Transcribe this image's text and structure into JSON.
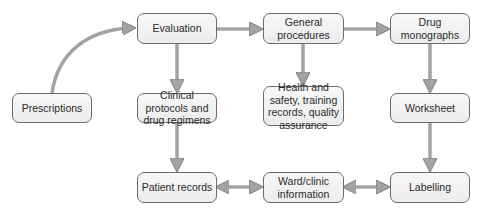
{
  "diagram": {
    "nodes": {
      "evaluation": "Evaluation",
      "general_procedures": "General procedures",
      "drug_monographs": "Drug monographs",
      "prescriptions": "Prescriptions",
      "clinical_protocols": "Clinical protocols and drug regimens",
      "health_safety": "Health and safety, training records, quality assurance",
      "worksheet": "Worksheet",
      "patient_records": "Patient records",
      "ward_clinic": "Ward/clinic information",
      "labelling": "Labelling"
    },
    "edges": [
      {
        "from": "prescriptions",
        "to": "evaluation",
        "type": "curved"
      },
      {
        "from": "evaluation",
        "to": "general_procedures"
      },
      {
        "from": "general_procedures",
        "to": "drug_monographs"
      },
      {
        "from": "evaluation",
        "to": "clinical_protocols"
      },
      {
        "from": "general_procedures",
        "to": "health_safety"
      },
      {
        "from": "drug_monographs",
        "to": "worksheet"
      },
      {
        "from": "clinical_protocols",
        "to": "patient_records"
      },
      {
        "from": "worksheet",
        "to": "labelling"
      },
      {
        "from": "patient_records",
        "to": "ward_clinic",
        "type": "bidirectional"
      },
      {
        "from": "ward_clinic",
        "to": "labelling",
        "type": "bidirectional"
      }
    ],
    "colors": {
      "arrow": "#a3a3a3",
      "border": "#6b6b6b"
    }
  }
}
